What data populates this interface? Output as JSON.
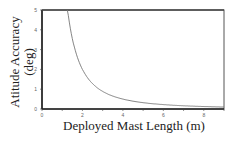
{
  "chart_data": {
    "type": "line",
    "title": "",
    "xlabel": "Deployed Mast Length (m)",
    "ylabel_line1": "Atitude Accuracy",
    "ylabel_line2": "(deg)",
    "xlim": [
      0,
      9
    ],
    "ylim": [
      0,
      5
    ],
    "xticks": [
      0,
      2,
      4,
      6,
      8
    ],
    "yticks": [
      0,
      1,
      2,
      3,
      4,
      5
    ],
    "grid": false,
    "series": [
      {
        "name": "accuracy",
        "x": [
          1.25,
          1.5,
          2,
          2.5,
          3,
          3.5,
          4,
          5,
          6,
          7,
          8,
          9
        ],
        "y": [
          5.0,
          3.6,
          2.0,
          1.3,
          0.9,
          0.65,
          0.5,
          0.32,
          0.22,
          0.16,
          0.13,
          0.1
        ]
      }
    ],
    "colors": {
      "line": "#777777",
      "axis": "#333333"
    }
  }
}
